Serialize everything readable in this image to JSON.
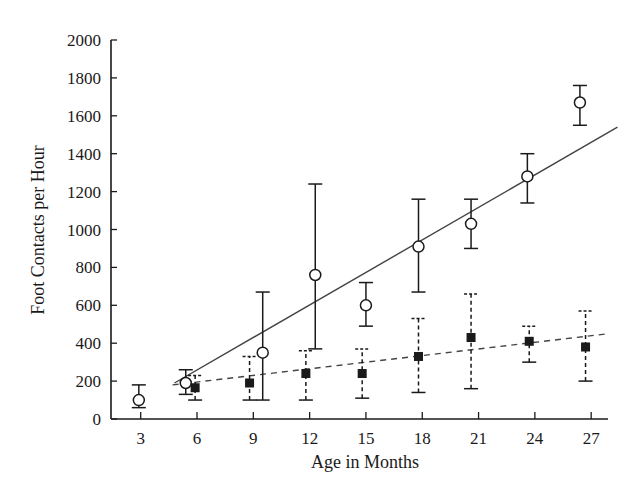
{
  "chart_data": {
    "type": "scatter",
    "title": "",
    "xlabel": "Age in Months",
    "ylabel": "Foot Contacts per Hour",
    "xlim": [
      1.4,
      28.4
    ],
    "ylim": [
      0,
      2000
    ],
    "x_ticks": [
      3,
      6,
      9,
      12,
      15,
      18,
      21,
      24,
      27
    ],
    "y_ticks": [
      0,
      200,
      400,
      600,
      800,
      1000,
      1200,
      1400,
      1600,
      1800,
      2000
    ],
    "grid": false,
    "legend": null,
    "series": [
      {
        "name": "open-circles",
        "marker": "open-circle",
        "errorbar_style": "solid",
        "points": [
          {
            "x": 2.9,
            "y": 100,
            "lo": 60,
            "hi": 180
          },
          {
            "x": 5.4,
            "y": 190,
            "lo": 130,
            "hi": 260
          },
          {
            "x": 9.5,
            "y": 350,
            "lo": 100,
            "hi": 670
          },
          {
            "x": 12.3,
            "y": 760,
            "lo": 370,
            "hi": 1240
          },
          {
            "x": 15.0,
            "y": 600,
            "lo": 490,
            "hi": 720
          },
          {
            "x": 17.8,
            "y": 910,
            "lo": 670,
            "hi": 1160
          },
          {
            "x": 20.6,
            "y": 1030,
            "lo": 900,
            "hi": 1160
          },
          {
            "x": 23.6,
            "y": 1280,
            "lo": 1140,
            "hi": 1400
          },
          {
            "x": 26.4,
            "y": 1670,
            "lo": 1550,
            "hi": 1760
          }
        ],
        "fit_line": {
          "style": "solid",
          "x": [
            4.8,
            28.4
          ],
          "y": [
            190,
            1540
          ]
        }
      },
      {
        "name": "filled-squares",
        "marker": "filled-square",
        "errorbar_style": "dashed",
        "points": [
          {
            "x": 5.9,
            "y": 165,
            "lo": 100,
            "hi": 230
          },
          {
            "x": 8.8,
            "y": 190,
            "lo": 100,
            "hi": 330
          },
          {
            "x": 11.8,
            "y": 240,
            "lo": 100,
            "hi": 360
          },
          {
            "x": 14.8,
            "y": 240,
            "lo": 110,
            "hi": 370
          },
          {
            "x": 17.8,
            "y": 330,
            "lo": 140,
            "hi": 530
          },
          {
            "x": 20.6,
            "y": 430,
            "lo": 160,
            "hi": 660
          },
          {
            "x": 23.7,
            "y": 410,
            "lo": 300,
            "hi": 490
          },
          {
            "x": 26.7,
            "y": 380,
            "lo": 200,
            "hi": 570
          }
        ],
        "fit_line": {
          "style": "dashed",
          "x": [
            4.7,
            27.9
          ],
          "y": [
            180,
            450
          ]
        }
      }
    ]
  },
  "colors": {
    "ink": "#1a1a1a",
    "line": "#444444",
    "background": "#ffffff"
  }
}
